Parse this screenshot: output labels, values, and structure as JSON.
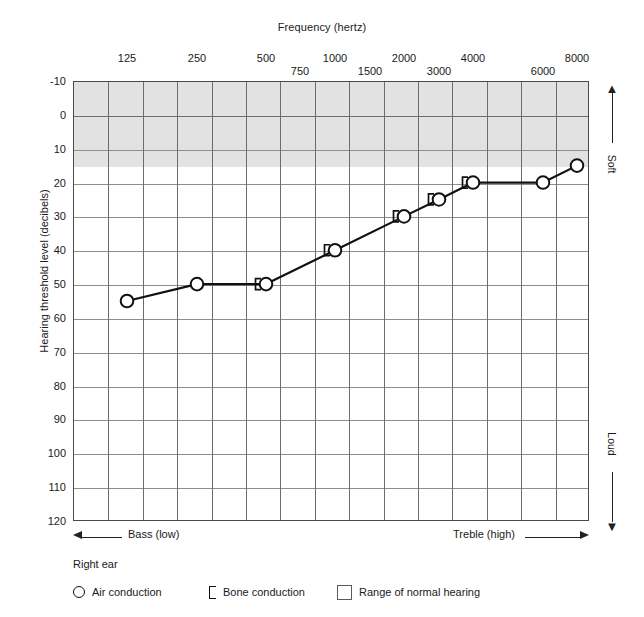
{
  "chart_data": {
    "type": "line",
    "title": "Frequency (hertz)",
    "xlabel": "Frequency (hertz)",
    "ylabel": "Hearing threshold level (decibels)",
    "ylim": [
      -10,
      120
    ],
    "y_inverted": true,
    "grid": true,
    "legend_position": "bottom-left",
    "x_tick_labels_top": [
      "125",
      "250",
      "500",
      "750",
      "1000",
      "1500",
      "2000",
      "3000",
      "4000",
      "6000",
      "8000"
    ],
    "x_tick_labels_upper_row": [
      "125",
      "250",
      "500",
      "1000",
      "2000",
      "4000",
      "8000"
    ],
    "x_tick_labels_lower_row": [
      "750",
      "1500",
      "3000",
      "6000"
    ],
    "x_octave_solid": [
      125,
      250,
      500,
      1000,
      2000,
      4000,
      8000
    ],
    "x_interoctave_dashed": [
      750,
      1500,
      3000,
      6000
    ],
    "y_ticks": [
      "-10",
      "0",
      "10",
      "20",
      "30",
      "40",
      "50",
      "60",
      "70",
      "80",
      "90",
      "100",
      "110",
      "120"
    ],
    "categories": [
      125,
      250,
      500,
      750,
      1000,
      1500,
      2000,
      3000,
      4000,
      6000,
      8000
    ],
    "normal_hearing_band": {
      "from": -10,
      "to": 15,
      "color": "#e2e2e2"
    },
    "series": [
      {
        "name": "Air conduction",
        "marker": "circle",
        "x": [
          125,
          250,
          500,
          1000,
          2000,
          3000,
          4000,
          6000,
          8000
        ],
        "values": [
          55,
          50,
          50,
          40,
          30,
          25,
          20,
          20,
          15
        ]
      },
      {
        "name": "Bone conduction",
        "marker": "bracket",
        "x": [
          500,
          1000,
          2000,
          3000,
          4000
        ],
        "values": [
          50,
          40,
          30,
          25,
          20
        ]
      }
    ],
    "annotations": {
      "top_arrow_label": "Soft",
      "bottom_arrow_label": "Loud",
      "left_axis_label": "Bass (low)",
      "right_axis_label": "Treble (high)"
    }
  },
  "axes": {
    "frequency_title": "Frequency (hertz)",
    "threshold_title": "Hearing threshold level (decibels)"
  },
  "side_labels": {
    "soft": "Soft",
    "loud": "Loud"
  },
  "range_labels": {
    "bass": "Bass (low)",
    "treble": "Treble (high)"
  },
  "legend": {
    "ear": "Right ear",
    "air_conduction": "Air conduction",
    "bone_conduction": "Bone conduction",
    "normal_range": "Range of normal hearing"
  },
  "colors": {
    "band": "#e2e2e2",
    "grid": "#8f8f8f",
    "frame": "#4a4a4a",
    "data": "#111111"
  }
}
